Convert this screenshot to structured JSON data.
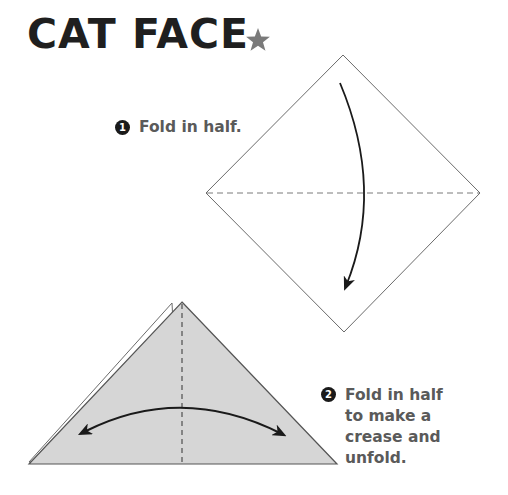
{
  "title": "CAT FACE",
  "difficulty": {
    "icon": "star-icon",
    "stars": 1,
    "color": "#7a7a7a"
  },
  "steps": [
    {
      "number": "1",
      "text": "Fold in half."
    },
    {
      "number": "2",
      "text": "Fold in half\nto make a\ncrease and\nunfold."
    }
  ],
  "colors": {
    "title": "#1f1f1f",
    "step_text": "#5a5a5a",
    "paper_front": "#d6d6d6",
    "paper_edge": "#6b6b6b",
    "arrow": "#1a1a1a"
  }
}
